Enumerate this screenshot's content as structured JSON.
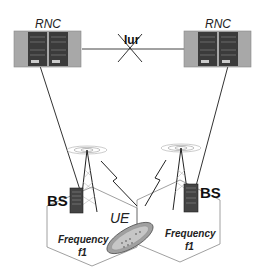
{
  "diagram": {
    "title": "",
    "nodes": {
      "rnc_left": {
        "label": "RNC"
      },
      "rnc_right": {
        "label": "RNC"
      },
      "bs_left": {
        "label": "BS"
      },
      "bs_right": {
        "label": "BS"
      },
      "ue": {
        "label": "UE"
      }
    },
    "links": {
      "iur": {
        "label": "Iur",
        "status": "crossed-out"
      }
    },
    "cells": [
      {
        "label_line1": "Frequency",
        "label_line2": "f1"
      },
      {
        "label_line1": "Frequency",
        "label_line2": "f1"
      }
    ],
    "colors": {
      "line": "#333333",
      "rack_outer": "#a9a9a9",
      "rack_inner": "#3a3a3a",
      "cell_border": "#888888",
      "phone": "#9a9a9a"
    }
  }
}
